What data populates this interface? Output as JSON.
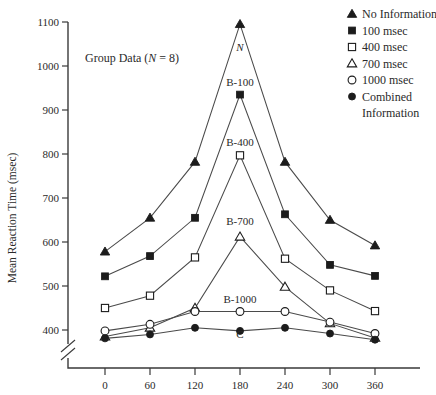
{
  "panel": {
    "title_prefix": "Group Data (",
    "title_n": "N",
    "title_suffix": " = 8)"
  },
  "axes": {
    "ylabel": "Mean Reaction Time (msec)",
    "xlabel": "",
    "yticks": [
      400,
      500,
      600,
      700,
      800,
      900,
      1000,
      1100
    ],
    "xticks": [
      0,
      60,
      120,
      180,
      240,
      300,
      360
    ],
    "ylim": [
      370,
      1100
    ],
    "xlim": [
      -30,
      390
    ],
    "axis_break": true,
    "grid": false
  },
  "legend": {
    "position": "top-right",
    "items": [
      {
        "label": "No Information",
        "marker": "filled-triangle"
      },
      {
        "label": "100 msec",
        "marker": "filled-square"
      },
      {
        "label": "400 msec",
        "marker": "open-square"
      },
      {
        "label": "700 msec",
        "marker": "open-triangle"
      },
      {
        "label": "1000 msec",
        "marker": "open-circle"
      },
      {
        "label": "Combined",
        "marker": "filled-circle"
      },
      {
        "label": "Information",
        "marker": "none"
      }
    ]
  },
  "curve_labels": [
    {
      "text": "N",
      "x": 180,
      "y": 1035
    },
    {
      "text": "B-100",
      "x": 180,
      "y": 955
    },
    {
      "text": "B-400",
      "x": 180,
      "y": 818
    },
    {
      "text": "B-700",
      "x": 180,
      "y": 638
    },
    {
      "text": "B-1000",
      "x": 180,
      "y": 462
    },
    {
      "text": "C",
      "x": 180,
      "y": 381
    }
  ],
  "chart_data": {
    "type": "line",
    "title": "Group Data (N = 8)",
    "xlabel": "",
    "ylabel": "Mean Reaction Time (msec)",
    "x": [
      0,
      60,
      120,
      180,
      240,
      300,
      360
    ],
    "xlim": [
      -30,
      390
    ],
    "ylim": [
      370,
      1100
    ],
    "yticks": [
      400,
      500,
      600,
      700,
      800,
      900,
      1000,
      1100
    ],
    "grid": false,
    "legend_position": "top-right",
    "series": [
      {
        "name": "No Information",
        "curve_label": "N",
        "marker": "filled-triangle",
        "values": [
          578,
          655,
          782,
          1095,
          782,
          650,
          592
        ]
      },
      {
        "name": "100 msec",
        "curve_label": "B-100",
        "marker": "filled-square",
        "values": [
          522,
          568,
          655,
          935,
          663,
          548,
          523
        ]
      },
      {
        "name": "400 msec",
        "curve_label": "B-400",
        "marker": "open-square",
        "values": [
          450,
          478,
          565,
          797,
          562,
          490,
          443
        ]
      },
      {
        "name": "700 msec",
        "curve_label": "B-700",
        "marker": "open-triangle",
        "values": [
          385,
          405,
          450,
          612,
          498,
          415,
          382
        ]
      },
      {
        "name": "1000 msec",
        "curve_label": "B-1000",
        "marker": "open-circle",
        "values": [
          398,
          413,
          442,
          442,
          442,
          418,
          392
        ]
      },
      {
        "name": "Combined Information",
        "curve_label": "C",
        "marker": "filled-circle",
        "values": [
          381,
          390,
          405,
          398,
          405,
          392,
          378
        ]
      }
    ]
  }
}
